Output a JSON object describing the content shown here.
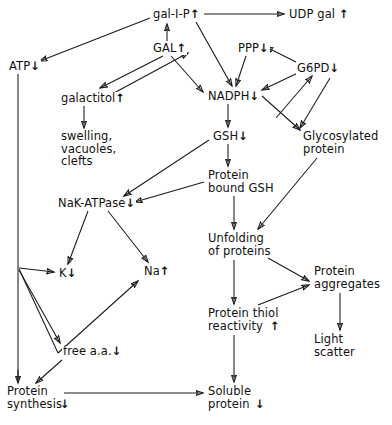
{
  "diagram": {
    "type": "flowchart",
    "background_color": "#ffffff",
    "line_color": "#1a1a1a",
    "text_color": "#111111",
    "arrow_up": "↑",
    "arrow_down": "↓",
    "nodes": [
      {
        "id": "gal1p",
        "label": "gal-I-P",
        "change": "↑",
        "x": 152,
        "y": 8,
        "align": "left"
      },
      {
        "id": "udpgal",
        "label": "UDP gal ",
        "change": "↑",
        "x": 288,
        "y": 8,
        "align": "left"
      },
      {
        "id": "gal",
        "label": "GAL",
        "change": "↑",
        "x": 152,
        "y": 42,
        "align": "left"
      },
      {
        "id": "ppp",
        "label": "PPP",
        "change": "↓",
        "x": 237,
        "y": 42,
        "align": "left"
      },
      {
        "id": "atp",
        "label": "ATP",
        "change": "↓",
        "x": 8,
        "y": 60,
        "align": "left"
      },
      {
        "id": "g6pd",
        "label": "G6PD",
        "change": "↓",
        "x": 296,
        "y": 62,
        "align": "left"
      },
      {
        "id": "galactitol",
        "label": "galactitol",
        "change": "↑",
        "x": 60,
        "y": 92,
        "align": "left"
      },
      {
        "id": "nadph",
        "label": "NADPH",
        "change": "↓",
        "x": 207,
        "y": 90,
        "align": "left"
      },
      {
        "id": "swelling",
        "label": "swelling,\nvacuoles,\nclefts",
        "change": "",
        "x": 60,
        "y": 130,
        "align": "left"
      },
      {
        "id": "gsh",
        "label": "GSH",
        "change": "↓",
        "x": 212,
        "y": 130,
        "align": "left"
      },
      {
        "id": "glycoprot",
        "label": "Glycosylated\nprotein",
        "change": "",
        "x": 302,
        "y": 130,
        "align": "left"
      },
      {
        "id": "pbgsh",
        "label": "Protein\nbound GSH",
        "change": "",
        "x": 207,
        "y": 169,
        "align": "left"
      },
      {
        "id": "nakatpase",
        "label": "NaK-ATPase",
        "change": "↓",
        "x": 57,
        "y": 197,
        "align": "left"
      },
      {
        "id": "unfolding",
        "label": "Unfolding\nof proteins",
        "change": "",
        "x": 207,
        "y": 232,
        "align": "left"
      },
      {
        "id": "k",
        "label": "K",
        "change": "↓",
        "x": 58,
        "y": 267,
        "align": "left"
      },
      {
        "id": "na",
        "label": "Na",
        "change": "↑",
        "x": 143,
        "y": 265,
        "align": "left"
      },
      {
        "id": "aggregates",
        "label": "Protein\naggregates",
        "change": "",
        "x": 313,
        "y": 265,
        "align": "left"
      },
      {
        "id": "thiol",
        "label": "Protein thiol\nreactivity ",
        "change": "↑",
        "x": 207,
        "y": 307,
        "align": "left"
      },
      {
        "id": "lightscat",
        "label": "Light\nscatter",
        "change": "",
        "x": 313,
        "y": 333,
        "align": "left"
      },
      {
        "id": "freeaa",
        "label": "free a.a.",
        "change": "↓",
        "x": 62,
        "y": 345,
        "align": "left"
      },
      {
        "id": "protsynth",
        "label": "Protein\nsynthesis",
        "change": "↓",
        "x": 6,
        "y": 385,
        "align": "left"
      },
      {
        "id": "solprot",
        "label": "Soluble\nprotein ",
        "change": "↓",
        "x": 207,
        "y": 385,
        "align": "left"
      }
    ],
    "edges": [
      {
        "from": "gal1p",
        "to": "udpgal",
        "style": "straight"
      },
      {
        "from": "gal1p",
        "to": "atp",
        "style": "straight"
      },
      {
        "from": "gal",
        "to": "gal1p",
        "style": "straight"
      },
      {
        "from": "gal",
        "to": "galactitol",
        "style": "straight"
      },
      {
        "from": "gal",
        "to": "nadph",
        "style": "straight"
      },
      {
        "from": "gal1p",
        "to": "nadph",
        "style": "straight"
      },
      {
        "from": "nadph",
        "to": "gal",
        "style": "straight"
      },
      {
        "from": "ppp",
        "to": "nadph",
        "style": "straight"
      },
      {
        "from": "g6pd",
        "to": "ppp",
        "style": "straight"
      },
      {
        "from": "g6pd",
        "to": "nadph",
        "style": "straight"
      },
      {
        "from": "nadph",
        "to": "g6pd",
        "style": "straight"
      },
      {
        "from": "nadph",
        "to": "glycoprot",
        "style": "straight"
      },
      {
        "from": "g6pd",
        "to": "glycoprot",
        "style": "straight"
      },
      {
        "from": "galactitol",
        "to": "swelling",
        "style": "straight"
      },
      {
        "from": "nadph",
        "to": "gsh",
        "style": "straight"
      },
      {
        "from": "gsh",
        "to": "pbgsh",
        "style": "straight"
      },
      {
        "from": "gsh",
        "to": "nakatpase",
        "style": "straight"
      },
      {
        "from": "pbgsh",
        "to": "nakatpase",
        "style": "straight"
      },
      {
        "from": "pbgsh",
        "to": "unfolding",
        "style": "straight"
      },
      {
        "from": "glycoprot",
        "to": "unfolding",
        "style": "straight"
      },
      {
        "from": "nakatpase",
        "to": "k",
        "style": "straight"
      },
      {
        "from": "nakatpase",
        "to": "na",
        "style": "straight"
      },
      {
        "from": "atp",
        "to": "k",
        "style": "elbow"
      },
      {
        "from": "atp",
        "to": "na",
        "style": "elbow"
      },
      {
        "from": "atp",
        "to": "freeaa",
        "style": "elbow"
      },
      {
        "from": "atp",
        "to": "protsynth",
        "style": "straight"
      },
      {
        "from": "freeaa",
        "to": "protsynth",
        "style": "straight"
      },
      {
        "from": "unfolding",
        "to": "thiol",
        "style": "straight"
      },
      {
        "from": "unfolding",
        "to": "aggregates",
        "style": "straight"
      },
      {
        "from": "thiol",
        "to": "aggregates",
        "style": "straight"
      },
      {
        "from": "thiol",
        "to": "solprot",
        "style": "straight"
      },
      {
        "from": "aggregates",
        "to": "lightscat",
        "style": "straight"
      },
      {
        "from": "protsynth",
        "to": "solprot",
        "style": "straight"
      }
    ]
  }
}
